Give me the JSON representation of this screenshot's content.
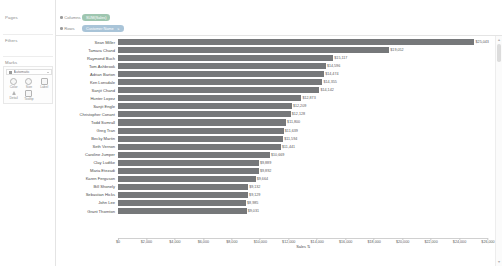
{
  "left_panel": {
    "pages_label": "Pages",
    "filters_label": "Filters",
    "marks_label": "Marks",
    "marks_type": "Automatic",
    "marks_buttons": [
      {
        "label": "Color",
        "icon": "color-palette-icon"
      },
      {
        "label": "Size",
        "icon": "size-icon"
      },
      {
        "label": "Label",
        "icon": "label-icon"
      },
      {
        "label": "Detail",
        "icon": "detail-icon"
      },
      {
        "label": "Tooltip",
        "icon": "tooltip-icon"
      }
    ]
  },
  "shelves": {
    "columns_label": "Columns",
    "columns_pill": "SUM(Sales)",
    "rows_label": "Rows",
    "rows_pill": "Customer Name",
    "rows_pill_sort": "⇅"
  },
  "scrollbar": {
    "up_arrow": "▲",
    "down_arrow": "▼"
  },
  "chart_data": {
    "type": "bar",
    "title": "",
    "orientation": "horizontal",
    "xlabel": "Sales",
    "xlabel_sort_glyph": "⇅",
    "ylabel": "Customer Name",
    "xlim": [
      0,
      26000
    ],
    "grid": false,
    "bar_color": "#76787a",
    "tick_labels": [
      "$0",
      "$2,000",
      "$4,000",
      "$6,000",
      "$8,000",
      "$10,000",
      "$12,000",
      "$14,000",
      "$16,000",
      "$18,000",
      "$20,000",
      "$22,000",
      "$24,000",
      "$26,000"
    ],
    "tick_values": [
      0,
      2000,
      4000,
      6000,
      8000,
      10000,
      12000,
      14000,
      16000,
      18000,
      20000,
      22000,
      24000,
      26000
    ],
    "categories": [
      "Sean Miller",
      "Tamara Chand",
      "Raymond Buch",
      "Tom Ashbrook",
      "Adrian Barton",
      "Ken Lonsdale",
      "Sanjit Chand",
      "Hunter Lopez",
      "Sanjit Engle",
      "Christopher Conant",
      "Todd Sumrall",
      "Greg Tran",
      "Becky Martin",
      "Seth Vernon",
      "Caroline Jumper",
      "Clay Ludtke",
      "Maria Etezadi",
      "Karen Ferguson",
      "Bill Shonely",
      "Sebastian Hicks",
      "John Lee",
      "Grant Thornton"
    ],
    "values": [
      25043,
      19052,
      15117,
      14596,
      14474,
      14355,
      14142,
      12873,
      12209,
      12128,
      11800,
      11639,
      11594,
      11441,
      10669,
      9889,
      9892,
      9664,
      9132,
      9129,
      8985,
      9031
    ],
    "value_labels": [
      "$25,043",
      "$19,052",
      "$15,117",
      "$14,596",
      "$14,474",
      "$14,355",
      "$14,142",
      "$12,873",
      "$12,209",
      "$12,128",
      "$11,800",
      "$11,639",
      "$11,594",
      "$11,441",
      "$10,669",
      "$9,889",
      "$9,892",
      "$9,664",
      "$9,132",
      "$9,129",
      "$8,985",
      "$9,031"
    ]
  }
}
